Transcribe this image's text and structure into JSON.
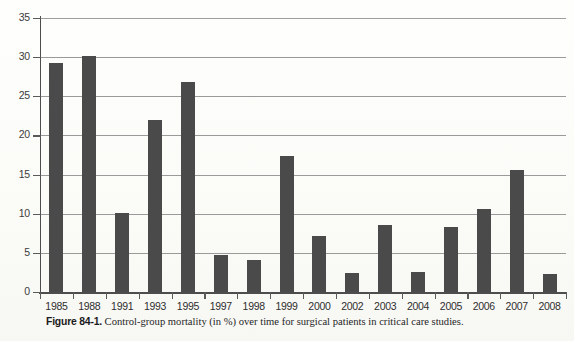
{
  "figure": {
    "caption_label": "Figure 84-1.",
    "caption_text": "Control-group mortality (in %) over time for surgical patients in critical care studies."
  },
  "colors": {
    "bar": "#4a4a4a",
    "gridline": "#9a9a9a",
    "axis": "#4d4d4d",
    "paper": "#fdfdfb",
    "text": "#2f2f2f"
  },
  "chart_data": {
    "type": "bar",
    "title": "",
    "subtitle": "",
    "xlabel": "",
    "ylabel": "",
    "ylim": [
      0,
      35
    ],
    "yticks": [
      0,
      5,
      10,
      15,
      20,
      25,
      30,
      35
    ],
    "ytick_labels": [
      "0",
      "5",
      "10",
      "15",
      "20",
      "25",
      "30",
      "35"
    ],
    "grid": true,
    "legend": false,
    "legend_position": "none",
    "categories": [
      "1985",
      "1988",
      "1991",
      "1993",
      "1995",
      "1997",
      "1998",
      "1999",
      "2000",
      "2002",
      "2003",
      "2004",
      "2005",
      "2006",
      "2007",
      "2008"
    ],
    "values": [
      29.2,
      30.1,
      10.1,
      22.0,
      26.8,
      4.7,
      4.1,
      17.4,
      7.2,
      2.4,
      8.5,
      2.6,
      8.3,
      10.6,
      15.6,
      2.3
    ],
    "series": [
      {
        "name": "Control-group mortality (%)",
        "values": [
          29.2,
          30.1,
          10.1,
          22.0,
          26.8,
          4.7,
          4.1,
          17.4,
          7.2,
          2.4,
          8.5,
          2.6,
          8.3,
          10.6,
          15.6,
          2.3
        ]
      }
    ]
  }
}
